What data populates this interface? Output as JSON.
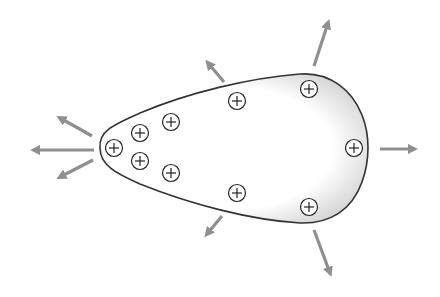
{
  "diagram": {
    "colors": {
      "outline": "#333333",
      "fill_light": "#ffffff",
      "fill_shade": "#d8d8d8",
      "arrow": "#8f8f8f",
      "charge_stroke": "#222222"
    },
    "charges": [
      {
        "symbol": "+",
        "x": 114,
        "y": 148
      },
      {
        "symbol": "+",
        "x": 140,
        "y": 133
      },
      {
        "symbol": "+",
        "x": 140,
        "y": 161
      },
      {
        "symbol": "+",
        "x": 171,
        "y": 122
      },
      {
        "symbol": "+",
        "x": 171,
        "y": 173
      },
      {
        "symbol": "+",
        "x": 237,
        "y": 101
      },
      {
        "symbol": "+",
        "x": 237,
        "y": 193
      },
      {
        "symbol": "+",
        "x": 309,
        "y": 89
      },
      {
        "symbol": "+",
        "x": 309,
        "y": 207
      },
      {
        "symbol": "+",
        "x": 354,
        "y": 148
      }
    ],
    "arrows": [
      {
        "name": "arrow-left",
        "x1": 94,
        "y1": 150,
        "x2": 34,
        "y2": 150
      },
      {
        "name": "arrow-upper-left",
        "x1": 92,
        "y1": 136,
        "x2": 60,
        "y2": 118
      },
      {
        "name": "arrow-lower-left",
        "x1": 93,
        "y1": 160,
        "x2": 60,
        "y2": 177
      },
      {
        "name": "arrow-top-small",
        "x1": 224,
        "y1": 82,
        "x2": 208,
        "y2": 63
      },
      {
        "name": "arrow-top-right",
        "x1": 314,
        "y1": 66,
        "x2": 328,
        "y2": 23
      },
      {
        "name": "arrow-right",
        "x1": 380,
        "y1": 149,
        "x2": 414,
        "y2": 149
      },
      {
        "name": "arrow-bottom-small",
        "x1": 222,
        "y1": 216,
        "x2": 207,
        "y2": 234
      },
      {
        "name": "arrow-bottom-right",
        "x1": 314,
        "y1": 230,
        "x2": 330,
        "y2": 273
      }
    ]
  }
}
